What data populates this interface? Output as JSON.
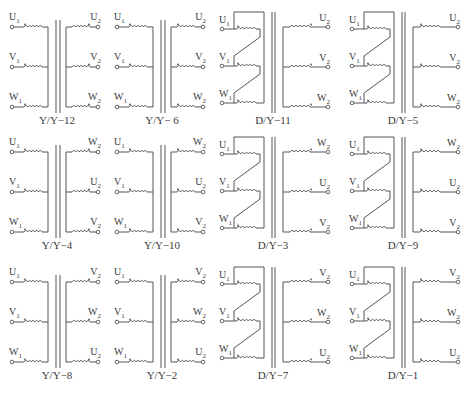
{
  "figure": {
    "stroke_color": "#555555",
    "text_color": "#3a3a3a"
  },
  "diagrams": [
    {
      "id": "yy12",
      "type": "YY",
      "caption": "Y/Y−12",
      "x": 0,
      "y": 0,
      "primary": [
        "U1",
        "V1",
        "W1"
      ],
      "secondary": [
        "U2",
        "V2",
        "W2"
      ],
      "sec_dot": "right"
    },
    {
      "id": "yy6",
      "type": "YY",
      "caption": "Y/Y− 6",
      "x": 105,
      "y": 0,
      "primary": [
        "U1",
        "V1",
        "W1"
      ],
      "secondary": [
        "U2",
        "V2",
        "W2"
      ],
      "sec_dot": "left"
    },
    {
      "id": "dy11",
      "type": "DY",
      "caption": "D/Y−11",
      "x": 210,
      "y": 0,
      "primary": [
        "U1",
        "V1",
        "W1"
      ],
      "secondary": [
        "U2",
        "V2",
        "W2"
      ],
      "sec_dot": "right"
    },
    {
      "id": "dy5",
      "type": "DY",
      "caption": "D/Y−5",
      "x": 340,
      "y": 0,
      "primary": [
        "U1",
        "V1",
        "W1"
      ],
      "secondary": [
        "U2",
        "V2",
        "W2"
      ],
      "sec_dot": "left"
    },
    {
      "id": "yy4",
      "type": "YY",
      "caption": "Y/Y−4",
      "x": 0,
      "y": 125,
      "primary": [
        "U1",
        "V1",
        "W1"
      ],
      "secondary": [
        "W2",
        "U2",
        "V2"
      ],
      "sec_dot": "right"
    },
    {
      "id": "yy10",
      "type": "YY",
      "caption": "Y/Y−10",
      "x": 105,
      "y": 125,
      "primary": [
        "U1",
        "V1",
        "W1"
      ],
      "secondary": [
        "W2",
        "U2",
        "V2"
      ],
      "sec_dot": "left"
    },
    {
      "id": "dy3",
      "type": "DY",
      "caption": "D/Y−3",
      "x": 210,
      "y": 125,
      "primary": [
        "U1",
        "V1",
        "W1"
      ],
      "secondary": [
        "W2",
        "U2",
        "V2"
      ],
      "sec_dot": "right"
    },
    {
      "id": "dy9",
      "type": "DY",
      "caption": "D/Y−9",
      "x": 340,
      "y": 125,
      "primary": [
        "U1",
        "V1",
        "W1"
      ],
      "secondary": [
        "W2",
        "U2",
        "V2"
      ],
      "sec_dot": "left"
    },
    {
      "id": "yy8",
      "type": "YY",
      "caption": "Y/Y−8",
      "x": 0,
      "y": 255,
      "primary": [
        "U1",
        "V1",
        "W1"
      ],
      "secondary": [
        "V2",
        "W2",
        "U2"
      ],
      "sec_dot": "right"
    },
    {
      "id": "yy2",
      "type": "YY",
      "caption": "Y/Y−2",
      "x": 105,
      "y": 255,
      "primary": [
        "U1",
        "V1",
        "W1"
      ],
      "secondary": [
        "V2",
        "W2",
        "U2"
      ],
      "sec_dot": "left"
    },
    {
      "id": "dy7",
      "type": "DY",
      "caption": "D/Y−7",
      "x": 210,
      "y": 255,
      "primary": [
        "U1",
        "V1",
        "W1"
      ],
      "secondary": [
        "V2",
        "W2",
        "U2"
      ],
      "sec_dot": "right"
    },
    {
      "id": "dy1",
      "type": "DY",
      "caption": "D/Y−1",
      "x": 340,
      "y": 255,
      "primary": [
        "U1",
        "V1",
        "W1"
      ],
      "secondary": [
        "V2",
        "W2",
        "U2"
      ],
      "sec_dot": "left"
    }
  ]
}
